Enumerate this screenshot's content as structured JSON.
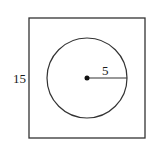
{
  "diagram": {
    "square": {
      "side_label": "15",
      "x": 29,
      "y": 18,
      "width": 116,
      "height": 120,
      "stroke": "#333333"
    },
    "circle": {
      "cx": 87,
      "cy": 78,
      "r": 40,
      "stroke": "#333333"
    },
    "center_point": {
      "cx": 87,
      "cy": 78,
      "r": 2.5,
      "fill": "#111111"
    },
    "radius": {
      "label": "5",
      "x1": 87,
      "y1": 78,
      "x2": 127,
      "y2": 78
    }
  }
}
